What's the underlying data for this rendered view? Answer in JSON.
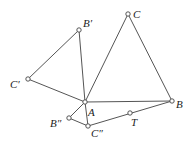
{
  "diagram": {
    "points": {
      "A": {
        "label": "A",
        "x": 85,
        "y": 102
      },
      "B": {
        "label": "B",
        "x": 172,
        "y": 101
      },
      "C": {
        "label": "C",
        "x": 128,
        "y": 14
      },
      "B1": {
        "label": "B′",
        "x": 79,
        "y": 30
      },
      "C1": {
        "label": "C′",
        "x": 28,
        "y": 79
      },
      "B2": {
        "label": "B″",
        "x": 69,
        "y": 118
      },
      "C2": {
        "label": "C″",
        "x": 88,
        "y": 126
      },
      "T": {
        "label": "T",
        "x": 130,
        "y": 113
      }
    },
    "segments": [
      [
        "A",
        "B"
      ],
      [
        "B",
        "C"
      ],
      [
        "C",
        "A"
      ],
      [
        "A",
        "B1"
      ],
      [
        "B1",
        "C1"
      ],
      [
        "C1",
        "A"
      ],
      [
        "A",
        "B2"
      ],
      [
        "B2",
        "C2"
      ],
      [
        "C2",
        "A"
      ],
      [
        "C2",
        "B"
      ]
    ],
    "colors": {
      "line": "#555555",
      "point_stroke": "#444444",
      "text": "#222222"
    }
  }
}
